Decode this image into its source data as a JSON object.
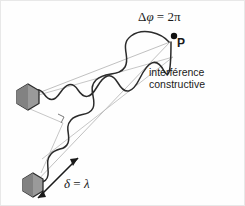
{
  "figure": {
    "background_color": "#fefefe",
    "border_color": "#e8e8e8",
    "labels": {
      "phase_difference": "Δφ = 2π",
      "phase_delta": "Δ",
      "phase_phi": "φ",
      "phase_equals": " = 2",
      "phase_pi": "π",
      "point_p": "P",
      "interference_line1": "interférence",
      "interference_line2": "constructive",
      "path_difference": "δ = λ",
      "path_delta_symbol": "δ",
      "path_equals": " = ",
      "path_lambda_symbol": "λ"
    },
    "colors": {
      "wave_stroke": "#2b2b2b",
      "axis_line": "#a9a9a9",
      "source_fill": "#9a9a9a",
      "source_fill_dark": "#7b7b7b",
      "source_stroke": "#2b2b2b",
      "text": "#1a1a1a",
      "arrow": "#1a1a1a"
    },
    "sources": [
      {
        "name": "source-upper",
        "cx": 27,
        "cy": 96,
        "r": 13
      },
      {
        "name": "source-lower",
        "cx": 32,
        "cy": 184,
        "r": 12
      }
    ],
    "observation_point": {
      "name": "point-P",
      "cx": 173,
      "cy": 35,
      "r": 3
    },
    "axis_lines": [
      {
        "name": "axis-upper-wave",
        "x1": 27,
        "y1": 96,
        "x2": 168,
        "y2": 42
      },
      {
        "name": "axis-lower-wave",
        "x1": 32,
        "y1": 184,
        "x2": 168,
        "y2": 42
      },
      {
        "name": "axis-secondary-upper",
        "x1": 27,
        "y1": 96,
        "x2": 171,
        "y2": 55
      },
      {
        "name": "axis-secondary-lower",
        "x1": 40,
        "y1": 160,
        "x2": 171,
        "y2": 55
      }
    ],
    "right_angle_marker": {
      "name": "right-angle-marker",
      "x": 58,
      "y": 116
    },
    "path_difference_arrow": {
      "name": "path-difference-arrow",
      "x1": 36,
      "y1": 198,
      "x2": 78,
      "y2": 156,
      "double_headed": true
    },
    "waves": {
      "upper": {
        "name": "wave-upper",
        "start_x": 27,
        "start_y": 96,
        "end_x": 170,
        "end_y": 40,
        "cycles": 4,
        "amplitude_start": 4,
        "amplitude_end": 22
      },
      "lower": {
        "name": "wave-lower",
        "start_x": 32,
        "start_y": 184,
        "end_x": 170,
        "end_y": 40,
        "cycles": 4,
        "amplitude_start": 4,
        "amplitude_end": 22
      }
    }
  }
}
